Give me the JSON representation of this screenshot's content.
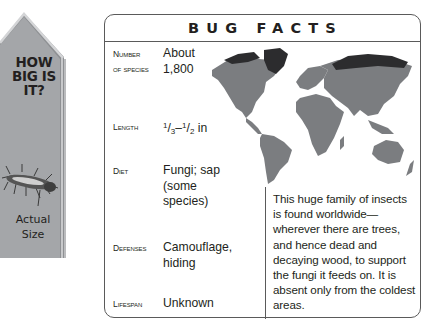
{
  "pennant": {
    "title_lines": [
      "HOW",
      "BIG IS",
      "IT?"
    ],
    "caption_lines": [
      "Actual",
      "Size"
    ],
    "colors": {
      "fill": "#a7a9ac",
      "highlight": "#d1d3d4",
      "shadow": "#8a8c8e"
    }
  },
  "card": {
    "title": "BUG FACTS",
    "facts": [
      {
        "label_lines": [
          "Number",
          "of species"
        ],
        "value_lines": [
          "About",
          "1,800"
        ]
      },
      {
        "label_lines": [
          "Length"
        ],
        "value": {
          "a_num": "1",
          "a_den": "3",
          "sep": "–",
          "b_num": "1",
          "b_den": "2",
          "unit": " in"
        }
      },
      {
        "label_lines": [
          "Diet"
        ],
        "value_lines": [
          "Fungi; sap",
          "(some",
          "species)"
        ]
      },
      {
        "label_lines": [
          "Defenses"
        ],
        "value_lines": [
          "Camouflage,",
          "hiding"
        ]
      },
      {
        "label_lines": [
          "Lifespan"
        ],
        "value_lines": [
          "Unknown"
        ]
      }
    ],
    "map": {
      "icon": "world-map-icon",
      "colors": {
        "range": "#7b7d80",
        "absent": "#2c2c2e"
      }
    },
    "description": "This huge family of insects is found worldwide—wherever there are trees, and hence dead and decaying wood, to support the fungi it feeds on. It is absent only from the coldest areas."
  }
}
